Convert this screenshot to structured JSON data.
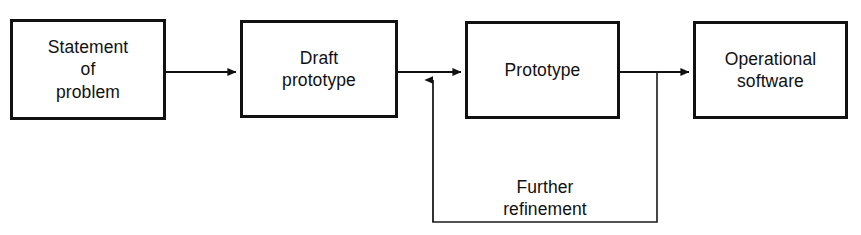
{
  "diagram": {
    "background_color": "#ffffff",
    "line_color": "#111111",
    "text_color": "#111111",
    "nodes": [
      {
        "id": "statement",
        "label": "Statement\nof\nproblem",
        "shape": "rectangle"
      },
      {
        "id": "draft",
        "label": "Draft\nprototype",
        "shape": "rectangle"
      },
      {
        "id": "prototype",
        "label": "Prototype",
        "shape": "rectangle"
      },
      {
        "id": "operational",
        "label": "Operational\nsoftware",
        "shape": "rectangle"
      }
    ],
    "edges": [
      {
        "id": "e1",
        "from": "statement",
        "to": "draft",
        "label": "",
        "arrow": true
      },
      {
        "id": "e2",
        "from": "draft",
        "to": "prototype",
        "label": "",
        "arrow": true
      },
      {
        "id": "e3",
        "from": "prototype",
        "to": "operational",
        "label": "",
        "arrow": true
      },
      {
        "id": "e4",
        "from": "prototype",
        "to": "prototype",
        "label": "Further\nrefinement",
        "arrow": true,
        "kind": "feedback-loop"
      }
    ]
  }
}
